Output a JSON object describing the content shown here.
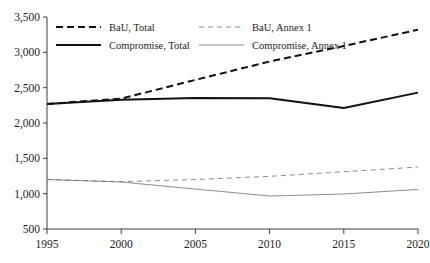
{
  "chart_data": {
    "type": "line",
    "title": "",
    "subtitle": "",
    "xlabel": "",
    "ylabel": "",
    "x": [
      1995,
      2000,
      2005,
      2010,
      2015,
      2020
    ],
    "categories": [
      "1995",
      "2000",
      "2005",
      "2010",
      "2015",
      "2020"
    ],
    "xlim": [
      1995,
      2020
    ],
    "ylim": [
      500,
      3500
    ],
    "y_ticks": [
      500,
      1000,
      1500,
      2000,
      2500,
      3000,
      3500
    ],
    "y_tick_labels": [
      "500",
      "1,000",
      "1,500",
      "2,000",
      "2,500",
      "3,000",
      "3,500"
    ],
    "x_ticks": [
      1995,
      2000,
      2005,
      2010,
      2015,
      2020
    ],
    "x_tick_labels": [
      "1995",
      "2000",
      "2005",
      "2010",
      "2015",
      "2020"
    ],
    "grid": false,
    "legend_position": "top-left-inside",
    "series": [
      {
        "name": "BaU, Total",
        "style": "dashed",
        "width": "thick",
        "color": "#111111",
        "values": [
          2270,
          2345,
          2610,
          2870,
          3090,
          3320
        ]
      },
      {
        "name": "BaU, Annex 1",
        "style": "dashed",
        "width": "thin",
        "color": "#6e6e6e",
        "values": [
          1200,
          1170,
          1200,
          1245,
          1310,
          1377
        ]
      },
      {
        "name": "Compromise, Total",
        "style": "solid",
        "width": "thick",
        "color": "#111111",
        "values": [
          2270,
          2330,
          2355,
          2350,
          2212,
          2430
        ]
      },
      {
        "name": "Compromise, Annex 1",
        "style": "solid",
        "width": "thin",
        "color": "#6e6e6e",
        "values": [
          1200,
          1165,
          1065,
          967,
          995,
          1060
        ]
      }
    ]
  },
  "legend": {
    "entries": [
      {
        "label": "BaU, Total"
      },
      {
        "label": "BaU, Annex 1"
      },
      {
        "label": "Compromise, Total"
      },
      {
        "label": "Compromise, Annex 1"
      }
    ]
  },
  "axis": {
    "y_labels": [
      "3,500",
      "3,000",
      "2,500",
      "2,000",
      "1,500",
      "1,000",
      "500"
    ],
    "x_labels": [
      "1995",
      "2000",
      "2005",
      "2010",
      "2015",
      "2020"
    ]
  }
}
